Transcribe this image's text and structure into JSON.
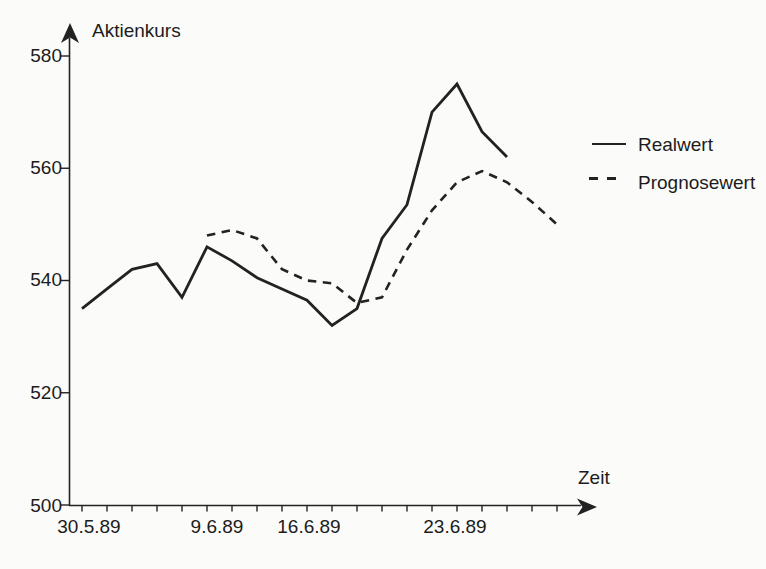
{
  "figure": {
    "background": "#fbfbf9",
    "ink": "#222222"
  },
  "chart_data": {
    "type": "line",
    "title": "",
    "ylabel": "Aktienkurs",
    "xlabel": "Zeit",
    "ylim": [
      500,
      585
    ],
    "y_ticks": [
      580,
      560,
      540,
      520,
      500
    ],
    "x_tick_labels": [
      "30.5.89",
      "9.6.89",
      "16.6.89",
      "23.6.89"
    ],
    "x_minor_tick_count": 20,
    "grid": false,
    "legend_position": "right",
    "legend": [
      {
        "label": "Realwert",
        "style": "solid"
      },
      {
        "label": "Prognosewert",
        "style": "dashed"
      }
    ],
    "series": [
      {
        "name": "Realwert",
        "style": "solid",
        "points": [
          [
            0,
            535
          ],
          [
            1,
            538.5
          ],
          [
            2,
            542
          ],
          [
            3,
            543
          ],
          [
            4,
            537
          ],
          [
            5,
            546
          ],
          [
            6,
            543.5
          ],
          [
            7,
            540.5
          ],
          [
            8,
            538.5
          ],
          [
            9,
            536.5
          ],
          [
            10,
            532
          ],
          [
            11,
            535
          ],
          [
            12,
            547.5
          ],
          [
            13,
            553.5
          ],
          [
            14,
            570
          ],
          [
            15,
            575
          ],
          [
            16,
            566.5
          ],
          [
            17,
            562
          ]
        ]
      },
      {
        "name": "Prognosewert",
        "style": "dashed",
        "points": [
          [
            5,
            548
          ],
          [
            6,
            549
          ],
          [
            7,
            547.5
          ],
          [
            8,
            542
          ],
          [
            9,
            540
          ],
          [
            10,
            539.5
          ],
          [
            11,
            536
          ],
          [
            12,
            537
          ],
          [
            13,
            545.5
          ],
          [
            14,
            552.5
          ],
          [
            15,
            557.5
          ],
          [
            16,
            559.5
          ],
          [
            17,
            557.5
          ],
          [
            18,
            554
          ],
          [
            19,
            550
          ]
        ]
      }
    ]
  }
}
